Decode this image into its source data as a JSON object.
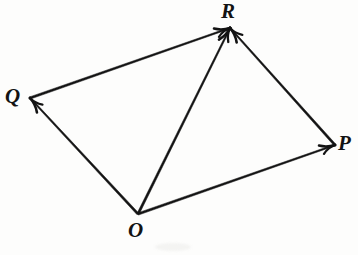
{
  "figure": {
    "kind": "vector-diagram",
    "background_color": "#fdfdfc",
    "ink_color": "#131313",
    "width": 358,
    "height": 255
  },
  "points": [
    {
      "id": "O",
      "label": "O",
      "x": 138,
      "y": 214,
      "label_x": 128,
      "label_y": 220
    },
    {
      "id": "P",
      "label": "P",
      "x": 335,
      "y": 145,
      "label_x": 338,
      "label_y": 133
    },
    {
      "id": "Q",
      "label": "Q",
      "x": 30,
      "y": 98,
      "label_x": 5,
      "label_y": 86
    },
    {
      "id": "R",
      "label": "R",
      "x": 230,
      "y": 28,
      "label_x": 221,
      "label_y": 1
    }
  ],
  "vectors": [
    {
      "id": "OP",
      "from": "O",
      "to": "P",
      "arrow_at": "to",
      "x1": 138,
      "y1": 214,
      "x2": 335,
      "y2": 145
    },
    {
      "id": "OQ",
      "from": "O",
      "to": "Q",
      "arrow_at": "to",
      "x1": 138,
      "y1": 214,
      "x2": 30,
      "y2": 98
    },
    {
      "id": "OR",
      "from": "O",
      "to": "R",
      "arrow_at": "to",
      "x1": 138,
      "y1": 214,
      "x2": 230,
      "y2": 28
    },
    {
      "id": "QR",
      "from": "Q",
      "to": "R",
      "arrow_at": "to",
      "x1": 30,
      "y1": 98,
      "x2": 230,
      "y2": 28
    },
    {
      "id": "PR",
      "from": "P",
      "to": "R",
      "arrow_at": "to",
      "x1": 335,
      "y1": 145,
      "x2": 230,
      "y2": 28
    }
  ]
}
